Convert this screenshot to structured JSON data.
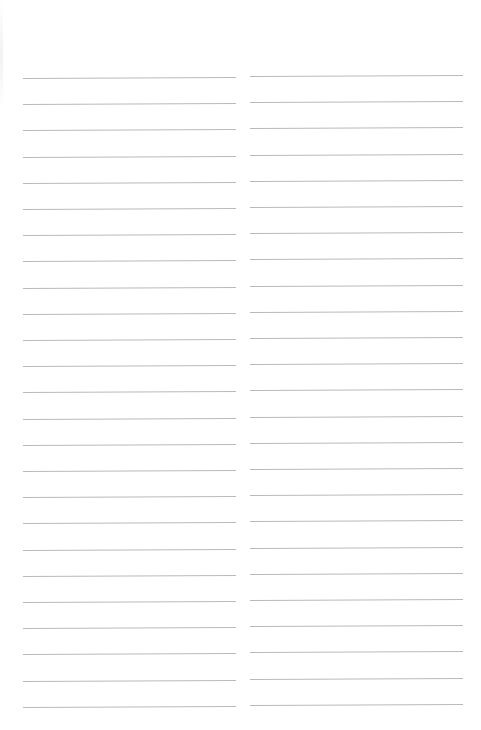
{
  "page": {
    "type": "blank lined paper",
    "background_color": "#ffffff",
    "line_color": "#b9b9b9",
    "columns": [
      {
        "name": "left",
        "line_count": 25,
        "first_line_y": 78,
        "line_spacing": 26.2
      },
      {
        "name": "right",
        "line_count": 25,
        "first_line_y": 76,
        "line_spacing": 26.2
      }
    ]
  }
}
